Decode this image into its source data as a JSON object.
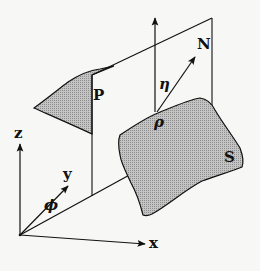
{
  "diagram": {
    "labels": {
      "z": "z",
      "y": "y",
      "x": "x",
      "phi": "ϕ",
      "P": "P",
      "eta": "η",
      "N": "N",
      "rho": "ρ",
      "S": "S"
    },
    "colors": {
      "line": "#111111",
      "surface_fill": "#b8b8b8",
      "background": "#f7f7f5"
    }
  }
}
